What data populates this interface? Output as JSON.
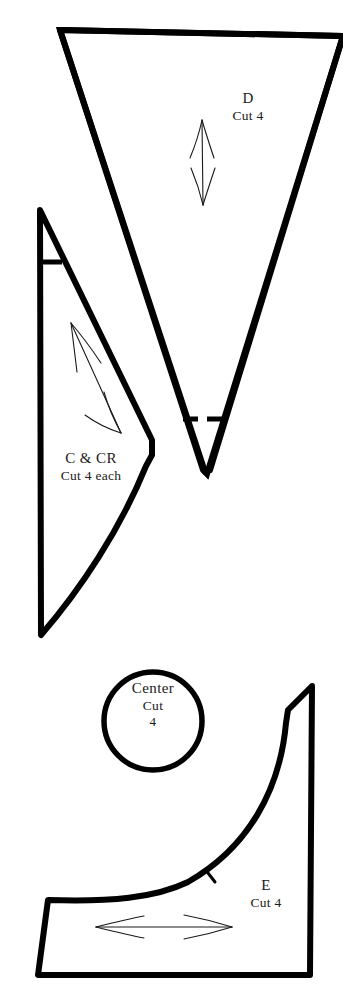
{
  "document": {
    "kind": "sewing-pattern-sheet",
    "background_color": "#ffffff",
    "ink_color": "#000000",
    "width": 343,
    "height": 1001
  },
  "pieces": [
    {
      "id": "d",
      "label": "D",
      "quantity_text": "Cut 4",
      "shape": "tapered-triangle-with-notch",
      "grain_arrow": "vertical-double-headed"
    },
    {
      "id": "c",
      "label": "C & CR",
      "quantity_text": "Cut 4 each",
      "shape": "curved-wedge",
      "grain_arrow": "diagonal-double-headed"
    },
    {
      "id": "center",
      "label": "Center",
      "quantity_text": "Cut",
      "quantity_number": "4",
      "shape": "circle"
    },
    {
      "id": "e",
      "label": "E",
      "quantity_text": "Cut 4",
      "shape": "curved-quarter-panel",
      "grain_arrow": "horizontal-double-headed"
    }
  ]
}
